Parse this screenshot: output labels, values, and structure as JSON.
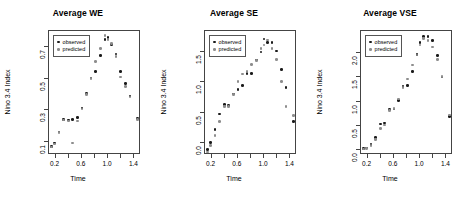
{
  "figure": {
    "panel_count": 3,
    "shared_xlabel": "Time",
    "shared_ylabel": "Nino 3.4 Index",
    "legend": {
      "observed_label": "observed",
      "predicted_label": "predicted",
      "observed_color": "#1a1a1a",
      "predicted_color": "#8d8d8d"
    }
  },
  "chart_data": [
    {
      "type": "scatter",
      "title": "Average WE",
      "xlabel": "Time",
      "ylabel": "Nino 3.4 Index",
      "xlim": [
        0.1,
        1.5
      ],
      "ylim": [
        0.02,
        0.8
      ],
      "xticks": [
        0.2,
        0.6,
        1.0,
        1.4
      ],
      "yticks": [
        0.1,
        0.3,
        0.5,
        0.7
      ],
      "grid": false,
      "legend_position": "top-left",
      "series": [
        {
          "name": "observed",
          "x": [
            0.14,
            0.18,
            0.25,
            0.32,
            0.4,
            0.46,
            0.53,
            0.6,
            0.67,
            0.74,
            0.81,
            0.88,
            0.95,
            1.0,
            1.05,
            1.12,
            1.19,
            1.26,
            1.33,
            1.45
          ],
          "y": [
            0.075,
            0.095,
            0.165,
            0.245,
            0.24,
            0.245,
            0.255,
            0.315,
            0.405,
            0.505,
            0.545,
            0.645,
            0.745,
            0.76,
            0.715,
            0.655,
            0.545,
            0.47,
            0.39,
            0.25
          ]
        },
        {
          "name": "predicted",
          "x": [
            0.14,
            0.18,
            0.25,
            0.32,
            0.4,
            0.46,
            0.53,
            0.6,
            0.67,
            0.74,
            0.81,
            0.88,
            0.95,
            1.0,
            1.05,
            1.12,
            1.19,
            1.26,
            1.33,
            1.45
          ],
          "y": [
            0.07,
            0.09,
            0.16,
            0.24,
            0.235,
            0.095,
            0.235,
            0.31,
            0.4,
            0.5,
            0.61,
            0.69,
            0.77,
            0.745,
            0.72,
            0.64,
            0.51,
            0.45,
            0.385,
            0.245
          ]
        }
      ]
    },
    {
      "type": "scatter",
      "title": "Average SE",
      "xlabel": "Time",
      "ylabel": "Nino 3.4 Index",
      "xlim": [
        0.1,
        1.5
      ],
      "ylim": [
        -0.2,
        1.85
      ],
      "xticks": [
        0.2,
        0.6,
        1.0,
        1.4
      ],
      "yticks": [
        0.0,
        0.5,
        1.0,
        1.5
      ],
      "grid": false,
      "legend_position": "top-left",
      "series": [
        {
          "name": "observed",
          "x": [
            0.14,
            0.18,
            0.25,
            0.32,
            0.4,
            0.46,
            0.53,
            0.6,
            0.67,
            0.74,
            0.81,
            0.88,
            0.95,
            1.0,
            1.05,
            1.12,
            1.19,
            1.26,
            1.33,
            1.45
          ],
          "y": [
            -0.11,
            0.01,
            0.22,
            0.48,
            0.63,
            0.62,
            0.81,
            0.88,
            0.95,
            1.15,
            1.15,
            1.37,
            1.5,
            1.72,
            1.66,
            1.66,
            1.52,
            1.21,
            0.92,
            0.35
          ]
        },
        {
          "name": "predicted",
          "x": [
            0.14,
            0.18,
            0.25,
            0.32,
            0.4,
            0.46,
            0.53,
            0.6,
            0.67,
            0.74,
            0.81,
            0.88,
            0.95,
            1.0,
            1.05,
            1.12,
            1.19,
            1.26,
            1.33,
            1.45
          ],
          "y": [
            -0.15,
            -0.04,
            0.12,
            0.35,
            0.6,
            0.6,
            0.8,
            1.02,
            1.14,
            1.18,
            1.3,
            1.36,
            1.56,
            1.62,
            1.7,
            1.56,
            1.38,
            1.02,
            0.6,
            0.45
          ]
        }
      ]
    },
    {
      "type": "scatter",
      "title": "Average VSE",
      "xlabel": "Time",
      "ylabel": "Nino 3.4 Index",
      "xlim": [
        0.1,
        1.5
      ],
      "ylim": [
        -0.1,
        2.45
      ],
      "xticks": [
        0.2,
        0.6,
        1.0,
        1.4
      ],
      "yticks": [
        0.0,
        0.5,
        1.0,
        1.5,
        2.0
      ],
      "grid": false,
      "legend_position": "top-left",
      "series": [
        {
          "name": "observed",
          "x": [
            0.14,
            0.18,
            0.25,
            0.32,
            0.4,
            0.46,
            0.53,
            0.6,
            0.67,
            0.74,
            0.81,
            0.88,
            0.95,
            1.0,
            1.05,
            1.12,
            1.19,
            1.26,
            1.33,
            1.45
          ],
          "y": [
            0.03,
            0.04,
            0.12,
            0.26,
            0.54,
            0.56,
            0.84,
            0.85,
            1.02,
            1.31,
            1.33,
            1.62,
            1.97,
            2.21,
            2.34,
            2.34,
            2.25,
            1.95,
            1.5,
            0.69
          ]
        },
        {
          "name": "predicted",
          "x": [
            0.14,
            0.18,
            0.25,
            0.32,
            0.4,
            0.46,
            0.53,
            0.6,
            0.67,
            0.74,
            0.81,
            0.88,
            0.95,
            1.0,
            1.05,
            1.12,
            1.19,
            1.26,
            1.33,
            1.45
          ],
          "y": [
            0.02,
            0.03,
            0.1,
            0.22,
            0.44,
            0.52,
            0.82,
            0.86,
            1.05,
            1.29,
            1.46,
            1.75,
            1.96,
            2.16,
            2.3,
            2.26,
            2.12,
            1.86,
            1.52,
            0.72
          ]
        }
      ]
    }
  ]
}
